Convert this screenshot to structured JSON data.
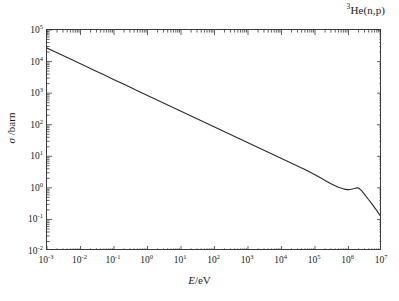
{
  "figure": {
    "reaction_label_prefix": "3",
    "reaction_label": "He(n,p)",
    "background_color": "#ffffff",
    "curve_color": "#2b2b2b",
    "axis_color": "#3a3a3a"
  },
  "axes": {
    "x": {
      "title_italic": "E",
      "title_rest": "/eV",
      "tick_mantissa": "10",
      "ticks": [
        {
          "exponent": "-3",
          "value": 0.001
        },
        {
          "exponent": "-2",
          "value": 0.01
        },
        {
          "exponent": "-1",
          "value": 0.1
        },
        {
          "exponent": "0",
          "value": 1
        },
        {
          "exponent": "1",
          "value": 10
        },
        {
          "exponent": "2",
          "value": 100
        },
        {
          "exponent": "3",
          "value": 1000
        },
        {
          "exponent": "4",
          "value": 10000
        },
        {
          "exponent": "5",
          "value": 100000
        },
        {
          "exponent": "6",
          "value": 1000000
        },
        {
          "exponent": "7",
          "value": 10000000
        }
      ]
    },
    "y": {
      "title_italic": "σ",
      "title_rest": " /barn",
      "tick_mantissa": "10",
      "ticks": [
        {
          "exponent": "5",
          "value": 100000
        },
        {
          "exponent": "4",
          "value": 10000
        },
        {
          "exponent": "3",
          "value": 1000
        },
        {
          "exponent": "2",
          "value": 100
        },
        {
          "exponent": "1",
          "value": 10
        },
        {
          "exponent": "0",
          "value": 1
        },
        {
          "exponent": "-1",
          "value": 0.1
        },
        {
          "exponent": "-2",
          "value": 0.01
        }
      ]
    }
  },
  "chart_data": {
    "type": "line",
    "title": "3He(n,p)",
    "xlabel": "E/eV",
    "ylabel": "σ /barn",
    "xscale": "log",
    "yscale": "log",
    "xlim": [
      0.001,
      10000000
    ],
    "ylim": [
      0.01,
      100000
    ],
    "grid": false,
    "legend": null,
    "series": [
      {
        "name": "3He(n,p) cross section",
        "color": "#2b2b2b",
        "x": [
          0.001,
          0.002,
          0.005,
          0.01,
          0.0253,
          0.05,
          0.1,
          0.2,
          0.5,
          1,
          2,
          5,
          10,
          20,
          50,
          100,
          200,
          500,
          1000,
          2000,
          5000,
          10000,
          20000,
          50000,
          100000,
          150000,
          200000,
          300000,
          500000,
          700000,
          900000,
          1000000,
          1200000,
          1500000,
          1800000,
          2000000,
          2500000,
          3000000,
          4000000,
          5000000,
          7000000,
          10000000
        ],
        "y": [
          26800,
          19000,
          12000,
          8480,
          5330,
          3790,
          2680,
          1900,
          1200,
          848,
          600,
          379,
          268,
          190,
          120,
          84.8,
          60.0,
          37.9,
          26.8,
          19.0,
          12.0,
          8.48,
          6.0,
          3.79,
          2.6,
          2.05,
          1.72,
          1.35,
          1.05,
          0.93,
          0.88,
          0.88,
          0.9,
          0.95,
          1.0,
          0.99,
          0.8,
          0.62,
          0.42,
          0.31,
          0.19,
          0.11
        ]
      }
    ],
    "annotations": [
      {
        "text": "1/v region",
        "x_range": [
          0.001,
          100000
        ]
      },
      {
        "text": "resonance plateau near 1 MeV",
        "x_range": [
          700000,
          2000000
        ]
      }
    ]
  }
}
